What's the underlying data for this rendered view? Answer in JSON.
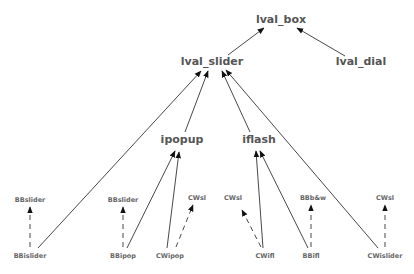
{
  "diagram": {
    "nodes": [
      {
        "id": "lval_box",
        "label": "lval_box",
        "x": 281,
        "y": 20,
        "size": "big"
      },
      {
        "id": "lval_slider",
        "label": "lval_slider",
        "x": 212,
        "y": 62,
        "size": "big"
      },
      {
        "id": "lval_dial",
        "label": "lval_dial",
        "x": 361,
        "y": 62,
        "size": "big"
      },
      {
        "id": "ipopup",
        "label": "ipopup",
        "x": 182,
        "y": 140,
        "size": "big"
      },
      {
        "id": "iflash",
        "label": "iflash",
        "x": 259,
        "y": 140,
        "size": "big"
      },
      {
        "id": "BBslider_1",
        "label": "BBslider",
        "x": 30,
        "y": 196,
        "size": "small"
      },
      {
        "id": "BBslider_2",
        "label": "BBslider",
        "x": 123,
        "y": 196,
        "size": "small"
      },
      {
        "id": "CWsl_1",
        "label": "CWsl",
        "x": 197,
        "y": 194,
        "size": "small"
      },
      {
        "id": "CWsl_2",
        "label": "CWsl",
        "x": 233,
        "y": 194,
        "size": "small"
      },
      {
        "id": "BBbw",
        "label": "BBb&w",
        "x": 313,
        "y": 194,
        "size": "small"
      },
      {
        "id": "CWsl_3",
        "label": "CWsl",
        "x": 385,
        "y": 194,
        "size": "small"
      },
      {
        "id": "BBislider",
        "label": "BBislider",
        "x": 30,
        "y": 255,
        "size": "small"
      },
      {
        "id": "BBipop",
        "label": "BBipop",
        "x": 123,
        "y": 255,
        "size": "small"
      },
      {
        "id": "CWipop",
        "label": "CWipop",
        "x": 170,
        "y": 255,
        "size": "small"
      },
      {
        "id": "CWifl",
        "label": "CWifl",
        "x": 265,
        "y": 255,
        "size": "small"
      },
      {
        "id": "BBifl",
        "label": "BBifl",
        "x": 311,
        "y": 255,
        "size": "small"
      },
      {
        "id": "CWislider",
        "label": "CWislider",
        "x": 385,
        "y": 255,
        "size": "small"
      }
    ],
    "edges": [
      {
        "from": "lval_slider",
        "to": "lval_box",
        "style": "solid"
      },
      {
        "from": "lval_dial",
        "to": "lval_box",
        "style": "solid"
      },
      {
        "from": "BBislider",
        "to": "lval_slider",
        "style": "solid"
      },
      {
        "from": "ipopup",
        "to": "lval_slider",
        "style": "solid"
      },
      {
        "from": "iflash",
        "to": "lval_slider",
        "style": "solid"
      },
      {
        "from": "CWislider",
        "to": "lval_slider",
        "style": "solid"
      },
      {
        "from": "BBipop",
        "to": "ipopup",
        "style": "solid"
      },
      {
        "from": "CWipop",
        "to": "ipopup",
        "style": "solid"
      },
      {
        "from": "CWifl",
        "to": "iflash",
        "style": "solid"
      },
      {
        "from": "BBifl",
        "to": "iflash",
        "style": "solid"
      },
      {
        "from": "BBislider",
        "to": "BBslider_1",
        "style": "dashed"
      },
      {
        "from": "BBipop",
        "to": "BBslider_2",
        "style": "dashed"
      },
      {
        "from": "CWipop",
        "to": "CWsl_1",
        "style": "dashed"
      },
      {
        "from": "CWifl",
        "to": "CWsl_2",
        "style": "dashed"
      },
      {
        "from": "BBifl",
        "to": "BBbw",
        "style": "dashed"
      },
      {
        "from": "CWislider",
        "to": "CWsl_3",
        "style": "dashed"
      }
    ],
    "colors": {
      "line": "#333333",
      "text": "#555555",
      "background": "#ffffff"
    }
  }
}
